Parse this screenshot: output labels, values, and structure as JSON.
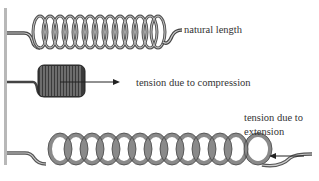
{
  "diagram": {
    "labels": {
      "natural": "natural length",
      "compression": "tension due to compression",
      "extension_line1": "tension due to",
      "extension_line2": "extension"
    },
    "springs": [
      {
        "name": "natural-length-spring",
        "coils": 13
      },
      {
        "name": "compressed-spring",
        "coils": 14
      },
      {
        "name": "extended-spring",
        "coils": 13
      }
    ],
    "colors": {
      "wall": "#b8b8b8",
      "spring_dark": "#444444",
      "spring_light": "#9a9a9a",
      "arrow": "#222222"
    }
  }
}
